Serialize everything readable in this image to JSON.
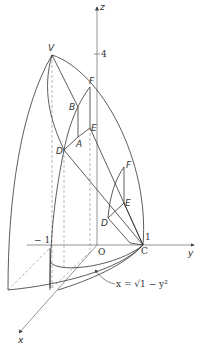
{
  "figure": {
    "type": "3d-solid-diagram",
    "axes": {
      "z_label": "z",
      "y_label": "y",
      "x_label": "x",
      "origin_label": "O",
      "z_tick_label": "4",
      "y_pos_tick_label": "1",
      "y_neg_tick_label": "− 1"
    },
    "points": {
      "V": "V",
      "F_upper": "F",
      "B": "B",
      "E_upper": "E",
      "A": "A",
      "D_upper": "D",
      "F_lower": "F",
      "E_lower": "E",
      "D_lower": "D",
      "C": "C"
    },
    "annotation": {
      "equation": "x = √1 − y²"
    },
    "colors": {
      "line": "#333333",
      "axis": "#555555",
      "dashed": "#777777"
    }
  }
}
